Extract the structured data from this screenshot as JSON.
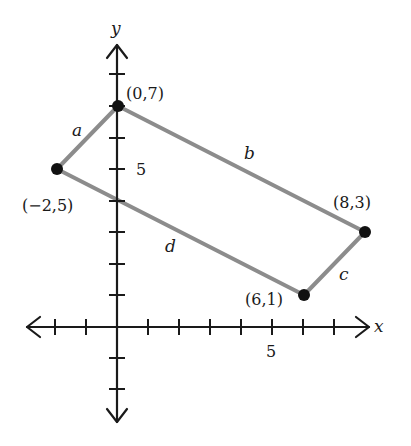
{
  "diagram": {
    "type": "coordinate-plane-quadrilateral",
    "axes": {
      "x_label": "x",
      "y_label": "y",
      "x_tick_label": "5",
      "y_tick_label": "5",
      "x_range": [
        -3,
        9
      ],
      "y_range": [
        -3,
        9
      ]
    },
    "vertices": [
      {
        "id": "A",
        "label": "(0,7)",
        "x": 0,
        "y": 7
      },
      {
        "id": "B",
        "label": "(8,3)",
        "x": 8,
        "y": 3
      },
      {
        "id": "C",
        "label": "(6,1)",
        "x": 6,
        "y": 1
      },
      {
        "id": "D",
        "label": "(−2,5)",
        "x": -2,
        "y": 5
      }
    ],
    "sides": [
      {
        "label": "a",
        "from": "D",
        "to": "A"
      },
      {
        "label": "b",
        "from": "A",
        "to": "B"
      },
      {
        "label": "c",
        "from": "B",
        "to": "C"
      },
      {
        "label": "d",
        "from": "C",
        "to": "D"
      }
    ],
    "colors": {
      "axis": "#1a1a1a",
      "side": "#8c8c8c",
      "point": "#111111"
    }
  }
}
